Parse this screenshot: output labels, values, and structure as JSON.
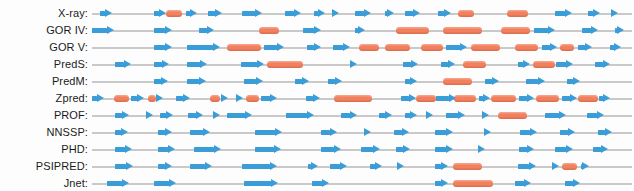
{
  "figure": {
    "colors": {
      "strand": "#3a9dd8",
      "helix": "#f0805e",
      "baseline": "#c9c9c9",
      "background": "#fdfdfd",
      "label_text": "#1b1b1b"
    },
    "legend_semantics": {
      "arrow": "beta-strand",
      "bar": "alpha-helix",
      "line": "coil"
    },
    "track": {
      "x_start_px": 92,
      "x_end_px": 632,
      "row_height_px": 17,
      "first_row_top_px": 5
    }
  },
  "rows": [
    {
      "label": "X-ray:",
      "strands": [
        {
          "start": 3.0,
          "width": 4.2
        },
        {
          "start": 22.5,
          "width": 4.2
        },
        {
          "start": 34.0,
          "width": 4.0
        },
        {
          "start": 42.0,
          "width": 5.2
        },
        {
          "start": 54.5,
          "width": 7.2
        },
        {
          "start": 70.0,
          "width": 6.0
        },
        {
          "start": 80.5,
          "width": 4.0
        },
        {
          "start": 88.0,
          "width": 1.8
        },
        {
          "start": 95.5,
          "width": 5.6
        },
        {
          "start": 106.5,
          "width": 3.2
        },
        {
          "start": 113.5,
          "width": 5.6
        },
        {
          "start": 125.5,
          "width": 4.8
        },
        {
          "start": 168.0,
          "width": 6.4
        },
        {
          "start": 180.0,
          "width": 4.4
        },
        {
          "start": 188.5,
          "width": 2.6
        }
      ],
      "helices": [
        {
          "start": 27.0,
          "width": 5.6
        },
        {
          "start": 133.0,
          "width": 5.6
        },
        {
          "start": 150.5,
          "width": 7.6
        }
      ]
    },
    {
      "label": "GOR IV:",
      "strands": [
        {
          "start": 0.0,
          "width": 8.0
        },
        {
          "start": 22.5,
          "width": 6.6
        },
        {
          "start": 39.0,
          "width": 5.4
        },
        {
          "start": 76.5,
          "width": 6.8
        },
        {
          "start": 95.5,
          "width": 3.6
        },
        {
          "start": 160.5,
          "width": 7.6
        },
        {
          "start": 178.0,
          "width": 5.6
        },
        {
          "start": 190.0,
          "width": 3.0
        }
      ],
      "helices": [
        {
          "start": 60.5,
          "width": 7.2
        },
        {
          "start": 110.5,
          "width": 12.0
        },
        {
          "start": 127.5,
          "width": 14.0
        },
        {
          "start": 148.5,
          "width": 10.5
        }
      ]
    },
    {
      "label": "GOR V:",
      "strands": [
        {
          "start": 22.5,
          "width": 6.6
        },
        {
          "start": 34.5,
          "width": 12.0
        },
        {
          "start": 62.5,
          "width": 7.2
        },
        {
          "start": 78.0,
          "width": 5.0
        },
        {
          "start": 87.5,
          "width": 6.2
        },
        {
          "start": 128.5,
          "width": 7.6
        },
        {
          "start": 163.5,
          "width": 5.4
        },
        {
          "start": 176.5,
          "width": 5.0
        },
        {
          "start": 188.0,
          "width": 4.0
        }
      ],
      "helices": [
        {
          "start": 49.0,
          "width": 12.5
        },
        {
          "start": 97.0,
          "width": 7.0
        },
        {
          "start": 106.5,
          "width": 9.0
        },
        {
          "start": 119.5,
          "width": 8.0
        },
        {
          "start": 137.5,
          "width": 10.5
        },
        {
          "start": 153.5,
          "width": 8.5
        },
        {
          "start": 170.0,
          "width": 5.0
        }
      ]
    },
    {
      "label": "PredS:",
      "strands": [
        {
          "start": 8.5,
          "width": 5.6
        },
        {
          "start": 22.5,
          "width": 5.4
        },
        {
          "start": 34.5,
          "width": 7.4
        },
        {
          "start": 54.0,
          "width": 8.6
        },
        {
          "start": 93.5,
          "width": 2.6
        },
        {
          "start": 113.0,
          "width": 5.2
        },
        {
          "start": 126.5,
          "width": 5.4
        },
        {
          "start": 154.5,
          "width": 4.6
        },
        {
          "start": 168.5,
          "width": 6.2
        },
        {
          "start": 182.5,
          "width": 5.4
        }
      ],
      "helices": [
        {
          "start": 63.5,
          "width": 13.0
        },
        {
          "start": 134.5,
          "width": 8.5
        },
        {
          "start": 160.0,
          "width": 8.0
        }
      ]
    },
    {
      "label": "PredM:",
      "strands": [
        {
          "start": 22.5,
          "width": 5.2
        },
        {
          "start": 34.5,
          "width": 7.0
        },
        {
          "start": 55.0,
          "width": 7.0
        },
        {
          "start": 73.5,
          "width": 5.2
        },
        {
          "start": 85.5,
          "width": 5.4
        },
        {
          "start": 113.5,
          "width": 4.6
        },
        {
          "start": 142.5,
          "width": 5.4
        },
        {
          "start": 157.5,
          "width": 7.0
        },
        {
          "start": 172.5,
          "width": 4.6
        }
      ],
      "helices": [
        {
          "start": 127.5,
          "width": 10.5
        }
      ]
    },
    {
      "label": "Zpred:",
      "strands": [
        {
          "start": 0.0,
          "width": 4.2
        },
        {
          "start": 14.0,
          "width": 5.0
        },
        {
          "start": 24.0,
          "width": 1.6
        },
        {
          "start": 30.5,
          "width": 5.0
        },
        {
          "start": 47.0,
          "width": 2.2
        },
        {
          "start": 52.5,
          "width": 2.2
        },
        {
          "start": 61.5,
          "width": 5.6
        },
        {
          "start": 77.5,
          "width": 5.2
        },
        {
          "start": 112.0,
          "width": 5.6
        },
        {
          "start": 125.0,
          "width": 7.2
        },
        {
          "start": 140.5,
          "width": 4.0
        },
        {
          "start": 155.0,
          "width": 5.6
        },
        {
          "start": 170.5,
          "width": 5.6
        },
        {
          "start": 184.0,
          "width": 4.0
        }
      ],
      "helices": [
        {
          "start": 8.0,
          "width": 5.6
        },
        {
          "start": 20.5,
          "width": 2.6
        },
        {
          "start": 43.0,
          "width": 3.4
        },
        {
          "start": 56.0,
          "width": 4.6
        },
        {
          "start": 88.0,
          "width": 13.5
        },
        {
          "start": 117.5,
          "width": 7.2
        },
        {
          "start": 131.5,
          "width": 8.0
        },
        {
          "start": 145.0,
          "width": 9.0
        },
        {
          "start": 161.0,
          "width": 8.5
        },
        {
          "start": 176.5,
          "width": 7.0
        }
      ]
    },
    {
      "label": "PROF:",
      "strands": [
        {
          "start": 8.5,
          "width": 5.0
        },
        {
          "start": 20.0,
          "width": 2.2
        },
        {
          "start": 24.5,
          "width": 5.0
        },
        {
          "start": 35.0,
          "width": 5.4
        },
        {
          "start": 44.5,
          "width": 2.0
        },
        {
          "start": 49.0,
          "width": 9.0
        },
        {
          "start": 70.5,
          "width": 10.0
        },
        {
          "start": 90.5,
          "width": 5.6
        },
        {
          "start": 104.0,
          "width": 5.0
        },
        {
          "start": 113.5,
          "width": 4.4
        },
        {
          "start": 121.5,
          "width": 2.2
        },
        {
          "start": 128.5,
          "width": 7.0
        },
        {
          "start": 142.0,
          "width": 2.0
        },
        {
          "start": 164.5,
          "width": 7.4
        },
        {
          "start": 179.5,
          "width": 6.4
        }
      ],
      "helices": [
        {
          "start": 147.5,
          "width": 10.5
        }
      ]
    },
    {
      "label": "NNSSP:",
      "strands": [
        {
          "start": 8.5,
          "width": 4.4
        },
        {
          "start": 24.0,
          "width": 5.0
        },
        {
          "start": 35.5,
          "width": 7.4
        },
        {
          "start": 59.0,
          "width": 10.0
        },
        {
          "start": 83.0,
          "width": 5.8
        },
        {
          "start": 99.0,
          "width": 2.2
        },
        {
          "start": 109.5,
          "width": 5.6
        },
        {
          "start": 124.5,
          "width": 6.4
        },
        {
          "start": 142.5,
          "width": 2.4
        },
        {
          "start": 155.5,
          "width": 6.0
        },
        {
          "start": 170.0,
          "width": 5.4
        },
        {
          "start": 183.5,
          "width": 5.4
        }
      ],
      "helices": []
    },
    {
      "label": "PHD:",
      "strands": [
        {
          "start": 8.5,
          "width": 6.0
        },
        {
          "start": 24.0,
          "width": 6.2
        },
        {
          "start": 37.0,
          "width": 10.0
        },
        {
          "start": 59.0,
          "width": 9.5
        },
        {
          "start": 83.0,
          "width": 7.4
        },
        {
          "start": 97.5,
          "width": 7.0
        },
        {
          "start": 110.5,
          "width": 5.0
        },
        {
          "start": 124.5,
          "width": 6.6
        },
        {
          "start": 141.0,
          "width": 1.8
        },
        {
          "start": 155.0,
          "width": 5.4
        },
        {
          "start": 168.0,
          "width": 6.6
        },
        {
          "start": 182.0,
          "width": 5.4
        }
      ],
      "helices": []
    },
    {
      "label": "PSIPRED:",
      "strands": [
        {
          "start": 8.5,
          "width": 6.4
        },
        {
          "start": 24.0,
          "width": 5.0
        },
        {
          "start": 35.5,
          "width": 8.0
        },
        {
          "start": 54.5,
          "width": 12.5
        },
        {
          "start": 78.5,
          "width": 3.4
        },
        {
          "start": 86.5,
          "width": 6.0
        },
        {
          "start": 101.0,
          "width": 4.4
        },
        {
          "start": 111.5,
          "width": 1.8
        },
        {
          "start": 124.5,
          "width": 4.8
        },
        {
          "start": 154.5,
          "width": 6.6
        },
        {
          "start": 167.5,
          "width": 2.0
        },
        {
          "start": 177.5,
          "width": 3.0
        }
      ],
      "helices": [
        {
          "start": 131.0,
          "width": 10.5
        },
        {
          "start": 170.5,
          "width": 5.6
        }
      ]
    },
    {
      "label": "Jnet:",
      "strands": [
        {
          "start": 5.5,
          "width": 8.0
        },
        {
          "start": 22.5,
          "width": 8.0
        },
        {
          "start": 55.0,
          "width": 12.5
        },
        {
          "start": 80.0,
          "width": 6.0
        },
        {
          "start": 124.5,
          "width": 4.6
        },
        {
          "start": 153.5,
          "width": 5.8
        },
        {
          "start": 171.5,
          "width": 5.6
        }
      ],
      "helices": [
        {
          "start": 131.0,
          "width": 14.5
        }
      ]
    }
  ]
}
